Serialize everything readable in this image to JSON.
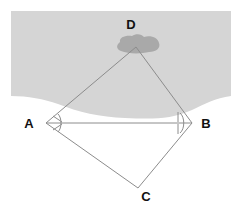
{
  "figure": {
    "canvas": {
      "width": 241,
      "height": 216
    },
    "background_color": "#ffffff"
  },
  "scene": {
    "water": {
      "name": "water-region",
      "fill": "#d5d5d5",
      "left": 11,
      "right": 231,
      "top": 11,
      "shore_y_edges": 96,
      "shore_y_center": 119
    },
    "island": {
      "name": "island-blob",
      "fill": "#a9a9a9",
      "bounds": {
        "x": 113,
        "y": 35,
        "width": 47,
        "height": 18
      }
    }
  },
  "points": {
    "A": {
      "label": "A",
      "x": 46,
      "y": 123,
      "label_x": 29,
      "label_y": 128
    },
    "B": {
      "label": "B",
      "x": 192,
      "y": 123,
      "label_x": 206,
      "label_y": 128
    },
    "C": {
      "label": "C",
      "x": 138,
      "y": 188,
      "label_x": 146,
      "label_y": 201
    },
    "D": {
      "label": "D",
      "x": 136,
      "y": 47,
      "label_x": 131,
      "label_y": 29
    }
  },
  "edges": [
    {
      "name": "edge-A-D",
      "from": "A",
      "to": "D"
    },
    {
      "name": "edge-D-B",
      "from": "D",
      "to": "B"
    },
    {
      "name": "edge-B-C",
      "from": "B",
      "to": "C"
    },
    {
      "name": "edge-C-A",
      "from": "C",
      "to": "A"
    },
    {
      "name": "edge-A-B",
      "from": "A",
      "to": "B"
    }
  ],
  "style": {
    "line_color": "#8c8c8c",
    "line_width": 1,
    "label_color": "#111111",
    "label_font_size": 13
  },
  "angle_marks": {
    "at_A": {
      "name": "angle-mark-A",
      "ticks": 2,
      "arc": true
    },
    "at_B": {
      "name": "angle-mark-B",
      "ticks": 2,
      "arc": true
    }
  }
}
